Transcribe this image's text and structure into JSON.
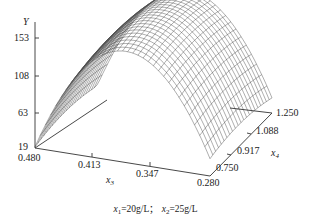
{
  "chart_data": {
    "type": "surface3d",
    "title": "",
    "zlabel": "Y",
    "xlabel": "x3",
    "ylabel": "x4",
    "z_ticks": [
      "19",
      "63",
      "108",
      "153"
    ],
    "x_ticks": [
      "0.480",
      "0.413",
      "0.347",
      "0.280"
    ],
    "y_ticks": [
      "0.750",
      "0.917",
      "1.088",
      "1.250"
    ],
    "zlim": [
      19,
      153
    ],
    "xlim": [
      0.48,
      0.28
    ],
    "ylim": [
      0.75,
      1.25
    ],
    "surface": {
      "description": "Concave-down parabolic response surface (dome) of Y over x3 and x4; peak near middle of x3 range, max ~160",
      "x3_samples": [
        0.48,
        0.413,
        0.347,
        0.28
      ],
      "x4_samples": [
        0.75,
        0.917,
        1.088,
        1.25
      ],
      "z_approx_at_front_edge_x4_0750": [
        55,
        130,
        140,
        25
      ],
      "z_approx_peak": 160
    },
    "caption": {
      "x1_label": "x",
      "x1_sub": "1",
      "x1_value": "=20g/L；",
      "x2_label": "x",
      "x2_sub": "2",
      "x2_value": "=25g/L"
    },
    "mesh_color": "#444444",
    "axis_color": "#333333"
  }
}
